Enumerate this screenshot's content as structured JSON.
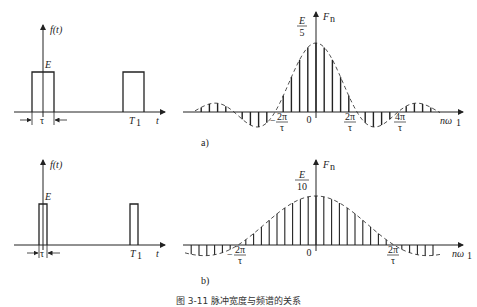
{
  "panels": [
    {
      "id": "a",
      "label": "a)",
      "time_plot": {
        "y_label": "f(t)",
        "x_label": "t",
        "amplitude_label": "E",
        "width_label": "τ",
        "period_label": "T",
        "period_sub": "1"
      },
      "spectrum": {
        "y_label": "F",
        "y_sub": "n",
        "x_label": "nω",
        "x_sub": "1",
        "peak_num": "E",
        "peak_den": "5",
        "origin": "0",
        "ticks": [
          {
            "sign": "−",
            "num": "2π",
            "den": "τ"
          },
          {
            "sign": "",
            "num": "2π",
            "den": "τ"
          },
          {
            "sign": "",
            "num": "4π",
            "den": "τ"
          }
        ]
      }
    },
    {
      "id": "b",
      "label": "b)",
      "time_plot": {
        "y_label": "f(t)",
        "x_label": "t",
        "amplitude_label": "E",
        "width_label": "τ",
        "period_label": "T",
        "period_sub": "1"
      },
      "spectrum": {
        "y_label": "F",
        "y_sub": "n",
        "x_label": "nω",
        "x_sub": "1",
        "peak_num": "E",
        "peak_den": "10",
        "origin": "0",
        "ticks": [
          {
            "sign": "−",
            "num": "2π",
            "den": "τ"
          },
          {
            "sign": "",
            "num": "2π",
            "den": "τ"
          }
        ]
      }
    }
  ],
  "caption": "图 3-11  脉冲宽度与频谱的关系",
  "chart_data": [
    {
      "type": "bar",
      "title": "a) Spectrum, T1 = 5τ",
      "xlabel": "nω1",
      "ylabel": "Fn",
      "peak": "E/5",
      "harmonic_index": [
        -11,
        -10,
        -9,
        -8,
        -7,
        -6,
        -5,
        -4,
        -3,
        -2,
        -1,
        0,
        1,
        2,
        3,
        4,
        5,
        6,
        7,
        8,
        9,
        10,
        11
      ],
      "relative_values": [
        0.07,
        0.0,
        -0.12,
        -0.19,
        -0.19,
        -0.14,
        0.0,
        0.19,
        0.43,
        0.75,
        0.94,
        1.0,
        0.94,
        0.75,
        0.43,
        0.19,
        0.0,
        -0.14,
        -0.19,
        -0.19,
        -0.12,
        0.0,
        0.07
      ],
      "envelope": "sinc, dashed"
    },
    {
      "type": "bar",
      "title": "b) Spectrum, T1 = 10τ",
      "xlabel": "nω1",
      "ylabel": "Fn",
      "peak": "E/10",
      "envelope": "sinc, dashed",
      "note": "harmonic spacing halved; 9 lines per side inside main lobe"
    }
  ]
}
